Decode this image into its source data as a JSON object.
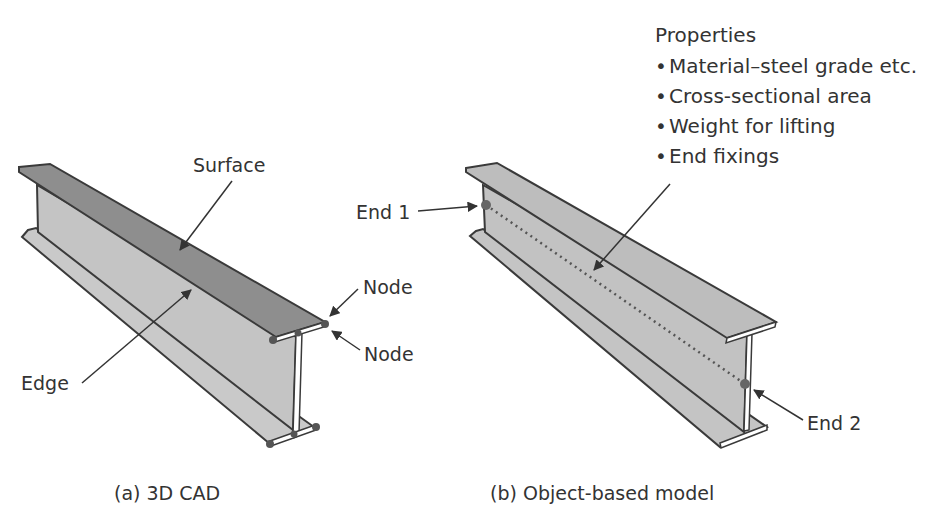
{
  "figure": {
    "panel_a": {
      "caption": "(a) 3D CAD",
      "labels": {
        "surface": "Surface",
        "edge": "Edge",
        "node_top": "Node",
        "node_bottom": "Node"
      }
    },
    "panel_b": {
      "caption": "(b) Object-based model",
      "labels": {
        "end1": "End 1",
        "end2": "End 2"
      },
      "properties": {
        "title": "Properties",
        "items": [
          "Material–steel grade etc.",
          "Cross-sectional area",
          "Weight for lifting",
          "End fixings"
        ],
        "bullet": "•"
      }
    },
    "colors": {
      "top_flange_a": "#8c8c8c",
      "web_fill": "#c4c4c4",
      "flange_fill_b": "#bdbdbd",
      "outline": "#3a3a3a",
      "node_dot": "#555555",
      "text": "#333333"
    }
  }
}
